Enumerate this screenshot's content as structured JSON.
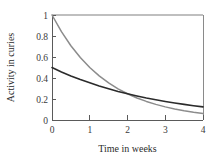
{
  "chart_data": {
    "type": "line",
    "title": "",
    "xlabel": "Time in weeks",
    "ylabel": "Activity in curies",
    "xlim": [
      0,
      4
    ],
    "ylim": [
      0,
      1
    ],
    "xticks": [
      "0",
      "1",
      "2",
      "3",
      "4"
    ],
    "xtick_values": [
      0,
      1,
      2,
      3,
      4
    ],
    "yticks": [
      "0",
      "0.2",
      "0.4",
      "0.6",
      "0.8",
      "1"
    ],
    "ytick_values": [
      0,
      0.2,
      0.4,
      0.6,
      0.8,
      1
    ],
    "grid": false,
    "legend": "none",
    "x": [
      0,
      0.25,
      0.5,
      0.75,
      1,
      1.25,
      1.5,
      1.75,
      2,
      2.25,
      2.5,
      2.75,
      3,
      3.25,
      3.5,
      3.75,
      4
    ],
    "series": [
      {
        "name": "fast-decay",
        "color": "#8c8c8c",
        "values": [
          1.0,
          0.841,
          0.707,
          0.595,
          0.5,
          0.42,
          0.354,
          0.297,
          0.25,
          0.21,
          0.177,
          0.149,
          0.125,
          0.105,
          0.088,
          0.074,
          0.0625
        ]
      },
      {
        "name": "slow-decay",
        "color": "#2b2b2b",
        "values": [
          0.5,
          0.458,
          0.42,
          0.385,
          0.354,
          0.324,
          0.297,
          0.272,
          0.25,
          0.229,
          0.21,
          0.193,
          0.177,
          0.162,
          0.149,
          0.136,
          0.125
        ]
      }
    ],
    "annotations": [],
    "crossing_point": {
      "x": 2,
      "y": 0.25
    }
  },
  "axes": {
    "x_title": "Time in weeks",
    "y_title": "Activity in curies"
  }
}
